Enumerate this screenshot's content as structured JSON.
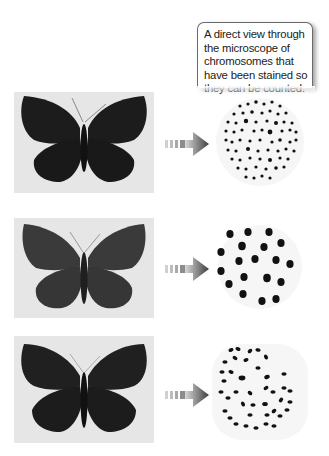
{
  "callout": {
    "lines": [
      "A direct view through",
      "the microscope of",
      "chromosomes that",
      "have been stained so",
      "they can be counted."
    ]
  },
  "rows": [
    {
      "butterfly": {
        "icon": "butterfly-icon",
        "wing_color": "#1c1c1c",
        "background": "#e6e6e6"
      },
      "arrow": {
        "icon": "arrow-right-icon",
        "color": "#555555"
      },
      "chromosomes": {
        "icon": "chromosome-spread-icon",
        "count_description": "many small chromosomes",
        "dot_color": "#111111"
      }
    },
    {
      "butterfly": {
        "icon": "butterfly-icon",
        "wing_color": "#3a3a3a",
        "background": "#e6e6e6"
      },
      "arrow": {
        "icon": "arrow-right-icon",
        "color": "#555555"
      },
      "chromosomes": {
        "icon": "chromosome-spread-icon",
        "count_description": "few large chromosomes",
        "dot_color": "#111111"
      }
    },
    {
      "butterfly": {
        "icon": "butterfly-icon",
        "wing_color": "#202020",
        "background": "#e6e6e6"
      },
      "arrow": {
        "icon": "arrow-right-icon",
        "color": "#555555"
      },
      "chromosomes": {
        "icon": "chromosome-spread-icon",
        "count_description": "intermediate number of elongated chromosomes",
        "dot_color": "#111111"
      }
    }
  ]
}
